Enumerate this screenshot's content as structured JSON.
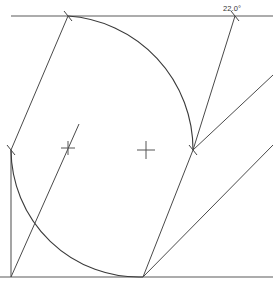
{
  "drawing": {
    "title": "angle-construction-sketch",
    "background_color": "#ffffff",
    "line_color": "#4a4a4a",
    "frame_color": "#5a5a5a",
    "arc_color": "#3a3a3a",
    "text_color": "#333333",
    "width": 273,
    "height": 287
  },
  "annotations": {
    "angle_dimension": "22.0°"
  },
  "geometry": {
    "frame": {
      "top_edge": "M 11 16 L 273 16",
      "bottom_edge": "M 0 277 L 273 277",
      "left_edge": "M 11 150 L 11 277"
    },
    "arcs": [
      {
        "name": "large-arc",
        "center_x": 146,
        "center_y": 150,
        "radius": 134,
        "start_x": 68,
        "start_y": 16,
        "end_x": 193,
        "end_y": 150,
        "path": "M 68 16 A 134 134 0 0 1 193 150"
      },
      {
        "name": "small-arc",
        "center_x": 68,
        "center_y": 150,
        "radius": 128,
        "start_x": 11,
        "start_y": 150,
        "end_x": 143,
        "end_y": 277,
        "path": "M 11 150 A 128 128 0 0 0 143 277"
      }
    ],
    "lines": [
      {
        "name": "left-upper-chord",
        "path": "M 11 150 L 68 16"
      },
      {
        "name": "lower-left-ray",
        "path": "M 11 277 L 79 124"
      },
      {
        "name": "bottom-vertex-steep-ray",
        "path": "M 143 277 L 193 150"
      },
      {
        "name": "bottom-vertex-shallow-ray",
        "path": "M 143 277 L 273 145"
      },
      {
        "name": "vertex-to-top-ray",
        "path": "M 193 150 L 235 16"
      },
      {
        "name": "vertex-to-right-ray",
        "path": "M 193 150 L 273 75"
      }
    ],
    "center_marks": [
      {
        "name": "center-mark-left",
        "x": 68,
        "y": 148,
        "size": 7
      },
      {
        "name": "center-mark-middle",
        "x": 146,
        "y": 150,
        "size": 9
      }
    ],
    "tick_marks": [
      {
        "name": "tick-top-left",
        "x": 68,
        "y": 16
      },
      {
        "name": "tick-top-right",
        "x": 235,
        "y": 16
      },
      {
        "name": "tick-left-edge",
        "x": 11,
        "y": 150
      },
      {
        "name": "tick-vertex-right",
        "x": 193,
        "y": 150
      }
    ],
    "label_position": {
      "x": 232,
      "y": 11
    }
  }
}
